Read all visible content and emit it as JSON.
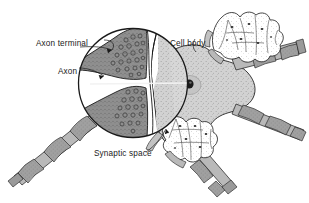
{
  "figure": {
    "kind": "biology-diagram",
    "background_color": "#ffffff"
  },
  "labels": [
    {
      "id": "axon-terminal",
      "text": "Axon terminal",
      "x": 36,
      "y": 43,
      "anchor": "start",
      "leader_to": [
        112,
        50
      ]
    },
    {
      "id": "axon",
      "text": "Axon",
      "x": 58,
      "y": 71,
      "anchor": "start",
      "leader_to": [
        104,
        76
      ]
    },
    {
      "id": "cell-body",
      "text": "Cell body",
      "x": 170,
      "y": 43,
      "anchor": "start",
      "leader_to": [
        196,
        52
      ]
    },
    {
      "id": "synaptic-space",
      "text": "Synaptic space",
      "x": 94,
      "y": 157,
      "anchor": "start",
      "leader_to": [
        166,
        129
      ]
    }
  ],
  "colors": {
    "outline": "#1a1a1a",
    "terminal_fill": "#8e8e8e",
    "cellbody_fill": "#cfcfcf",
    "myelin_fill": "#9a9a9a",
    "axon_fill": "#b9b9b9",
    "nucleus_fill": "#1a1a1a",
    "vesicle_stroke": "#4a4a4a",
    "stipple": "#6b6b6b",
    "label_text": "#1a1a1a"
  },
  "inset": {
    "shape": "circle",
    "center_x": 133,
    "center_y": 83,
    "radius": 55,
    "description": "magnified view of two axon terminals meeting the cell body across the synaptic space"
  },
  "structures": [
    {
      "id": "upper-axon-terminal",
      "label": "Axon terminal",
      "vesicles": 22
    },
    {
      "id": "lower-axon-terminal",
      "label": "Axon terminal",
      "vesicles": 18
    },
    {
      "id": "synaptic-cleft",
      "label": "Synaptic space"
    },
    {
      "id": "cell-body",
      "label": "Cell body",
      "has_nucleus": true
    },
    {
      "id": "myelinated-axon-lower-left",
      "label": "Axon",
      "myelin_segments": 4
    },
    {
      "id": "myelinated-axon-right",
      "label": "Axon",
      "myelin_segments": 4
    },
    {
      "id": "myelinated-axon-upper-right",
      "label": "Axon",
      "myelin_segments": 2
    },
    {
      "id": "myelinated-axon-lower-right",
      "label": "Axon",
      "myelin_segments": 2
    },
    {
      "id": "terminal-bouton-cluster-upper-right",
      "label": "Axon terminal"
    },
    {
      "id": "terminal-bouton-cluster-lower",
      "label": "Axon terminal"
    }
  ]
}
